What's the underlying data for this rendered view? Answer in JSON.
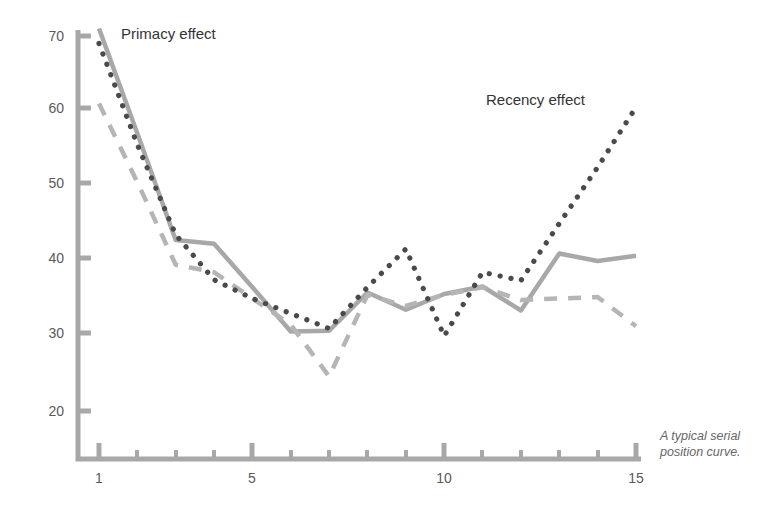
{
  "figure": {
    "caption_line1": "A typical serial",
    "caption_line2": "position curve.",
    "background_color": "#ffffff"
  },
  "annotations": [
    {
      "id": "primacy",
      "text": "Primacy effect",
      "x": 121,
      "y": 39
    },
    {
      "id": "recency",
      "text": "Recency effect",
      "x": 486,
      "y": 105
    }
  ],
  "axes": {
    "axis_color": "#a8a8a8",
    "label_color": "#595959",
    "y_ticks": [
      {
        "value": 70,
        "label": "70",
        "py": 36
      },
      {
        "value": 60,
        "label": "60",
        "py": 108
      },
      {
        "value": 50,
        "label": "50",
        "py": 183
      },
      {
        "value": 40,
        "label": "40",
        "py": 258
      },
      {
        "value": 30,
        "label": "30",
        "py": 333
      },
      {
        "value": 20,
        "label": "20",
        "py": 411
      }
    ],
    "x_ticks": [
      {
        "value": 1,
        "label": "1",
        "px": 99,
        "major": true
      },
      {
        "value": 2,
        "label": "",
        "px": 137,
        "major": false
      },
      {
        "value": 3,
        "label": "",
        "px": 176,
        "major": false
      },
      {
        "value": 4,
        "label": "",
        "px": 214,
        "major": false
      },
      {
        "value": 5,
        "label": "5",
        "px": 252,
        "major": true
      },
      {
        "value": 6,
        "label": "",
        "px": 291,
        "major": false
      },
      {
        "value": 7,
        "label": "",
        "px": 329,
        "major": false
      },
      {
        "value": 8,
        "label": "",
        "px": 367,
        "major": false
      },
      {
        "value": 9,
        "label": "",
        "px": 406,
        "major": false
      },
      {
        "value": 10,
        "label": "10",
        "px": 444,
        "major": true
      },
      {
        "value": 11,
        "label": "",
        "px": 482,
        "major": false
      },
      {
        "value": 12,
        "label": "",
        "px": 521,
        "major": false
      },
      {
        "value": 13,
        "label": "",
        "px": 559,
        "major": false
      },
      {
        "value": 14,
        "label": "",
        "px": 598,
        "major": false
      },
      {
        "value": 15,
        "label": "15",
        "px": 636,
        "major": true
      }
    ]
  },
  "chart_data": {
    "type": "line",
    "title": "",
    "subtitle": "",
    "xlabel": "",
    "ylabel": "",
    "xlim": [
      1,
      15
    ],
    "ylim": [
      20,
      72
    ],
    "grid": false,
    "legend_position": "none",
    "x": [
      1,
      2,
      3,
      4,
      5,
      6,
      7,
      8,
      9,
      10,
      11,
      12,
      13,
      14,
      15
    ],
    "categories": [
      "1",
      "2",
      "3",
      "4",
      "5",
      "6",
      "7",
      "8",
      "9",
      "10",
      "11",
      "12",
      "13",
      "14",
      "15"
    ],
    "series": [
      {
        "name": "solid-curve",
        "style": "solid",
        "color": "#a8a8a8",
        "width": 4.5,
        "values": [
          71.0,
          57.0,
          42.8,
          42.3,
          36.5,
          30.6,
          30.7,
          35.8,
          33.5,
          35.6,
          36.6,
          33.4,
          41.0,
          40.0,
          40.7
        ]
      },
      {
        "name": "dashed-curve",
        "style": "dashed",
        "color": "#b5b5b5",
        "width": 4.5,
        "values": [
          61.0,
          50.5,
          39.5,
          38.5,
          35.0,
          31.5,
          24.6,
          35.5,
          34.0,
          35.5,
          36.5,
          34.8,
          35.0,
          35.2,
          31.3
        ]
      },
      {
        "name": "dotted-curve",
        "style": "dotted",
        "color": "#4a4a4a",
        "width": 4.0,
        "values": [
          69.0,
          55.5,
          43.5,
          37.5,
          35.0,
          33.0,
          31.0,
          36.5,
          41.6,
          30.0,
          38.5,
          37.4,
          45.0,
          52.5,
          60.5
        ]
      }
    ],
    "annotations": [
      {
        "text": "Primacy effect",
        "near_x": 1.5,
        "near_y": 70
      },
      {
        "text": "Recency effect",
        "near_x": 12,
        "near_y": 61
      }
    ]
  }
}
